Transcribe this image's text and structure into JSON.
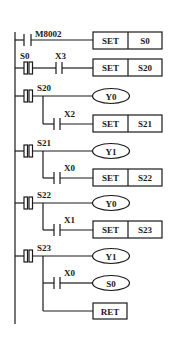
{
  "diagram": {
    "type": "ladder-logic-sfc-step-ladder",
    "rungs": [
      {
        "contact_type": "NO",
        "contact": "M8002",
        "instruction": "SET",
        "operand": "S0"
      },
      {
        "contact_type": "STL",
        "step": "S0",
        "condition": "X3",
        "instruction": "SET",
        "operand": "S20"
      },
      {
        "contact_type": "STL",
        "step": "S20",
        "output": "Y0",
        "condition": "X2",
        "instruction": "SET",
        "operand": "S21"
      },
      {
        "contact_type": "STL",
        "step": "S21",
        "output": "Y1",
        "condition": "X0",
        "instruction": "SET",
        "operand": "S22"
      },
      {
        "contact_type": "STL",
        "step": "S22",
        "output": "Y0",
        "condition": "X1",
        "instruction": "SET",
        "operand": "S23"
      },
      {
        "contact_type": "STL",
        "step": "S23",
        "output": "Y1",
        "condition": "X0",
        "jump_coil": "S0",
        "end": "RET"
      }
    ]
  },
  "labels": {
    "r1_contact": "M8002",
    "r1_instr": "SET",
    "r1_op": "S0",
    "r2_step": "S0",
    "r2_cond": "X3",
    "r2_instr": "SET",
    "r2_op": "S20",
    "r3_step": "S20",
    "r3_out": "Y0",
    "r3_cond": "X2",
    "r3_instr": "SET",
    "r3_op": "S21",
    "r4_step": "S21",
    "r4_out": "Y1",
    "r4_cond": "X0",
    "r4_instr": "SET",
    "r4_op": "S22",
    "r5_step": "S22",
    "r5_out": "Y0",
    "r5_cond": "X1",
    "r5_instr": "SET",
    "r5_op": "S23",
    "r6_step": "S23",
    "r6_out": "Y1",
    "r6_cond": "X0",
    "r6_jump": "S0",
    "r6_ret": "RET"
  }
}
